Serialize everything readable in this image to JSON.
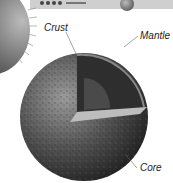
{
  "diagram": {
    "labels": {
      "crust": "Crust",
      "mantle": "Mantle",
      "core": "Core"
    },
    "top_strip_text": "• • • • ........"
  }
}
